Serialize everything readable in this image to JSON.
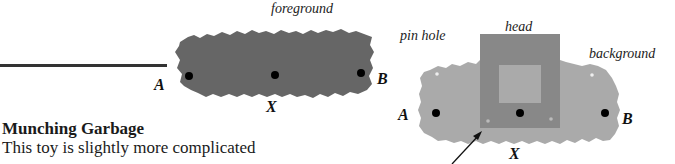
{
  "figure": {
    "left_diagram": {
      "labels": {
        "foreground": "foreground",
        "point_a": "A",
        "point_x": "X",
        "point_b": "B"
      },
      "colors": {
        "shape": "#666666",
        "dot": "#000000",
        "stick": "#333333"
      }
    },
    "right_diagram": {
      "labels": {
        "pin_hole": "pin hole",
        "head": "head",
        "background": "background",
        "point_a": "A",
        "point_x": "X",
        "point_b": "B"
      },
      "colors": {
        "background_shape": "#aaaaaa",
        "head": "#888888",
        "head_inner": "#aaaaaa",
        "pin_hole": "#e8e8e8",
        "dot": "#000000",
        "arrow": "#111111"
      }
    }
  },
  "section": {
    "title": "Munching Garbage",
    "body": "This toy is slightly more complicated"
  }
}
